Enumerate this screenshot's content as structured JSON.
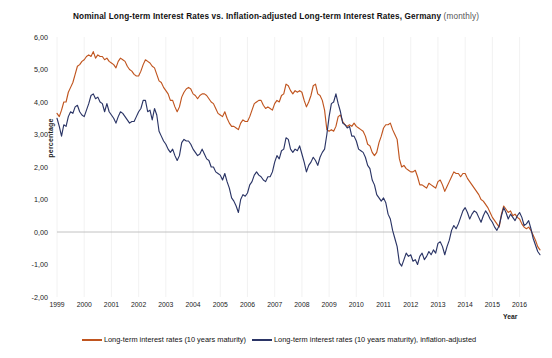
{
  "title": {
    "main": "Nominal Long-term Interest Rates vs. Inflation-adjusted Long-term Interest Rates, Germany",
    "suffix": "(monthly)"
  },
  "axes": {
    "ylabel": "percentage",
    "xlabel": "Year",
    "yticks": [
      "6,00",
      "5,00",
      "4,00",
      "3,00",
      "2,00",
      "1,00",
      "0,00",
      "-1,00",
      "-2,00"
    ],
    "xticks": [
      "1999",
      "2000",
      "2001",
      "2002",
      "2003",
      "2004",
      "2005",
      "2006",
      "2007",
      "2008",
      "2009",
      "2010",
      "2011",
      "2012",
      "2013",
      "2014",
      "2015",
      "2016"
    ]
  },
  "legend": {
    "items": [
      {
        "label": "Long-term interest rates (10 years maturity)",
        "color": "#C0551F"
      },
      {
        "label": "Long-term interest rates (10 years maturity), inflation-adjusted",
        "color": "#2B3566"
      }
    ]
  },
  "colors": {
    "nominal": "#C0551F",
    "real": "#2B3566",
    "zero_line": "#BBBBBB",
    "gridline": "#EFEFEF",
    "text": "#1a1a1a",
    "background": "#FFFFFF"
  },
  "chart_data": {
    "type": "line",
    "title": "Nominal Long-term Interest Rates vs. Inflation-adjusted Long-term Interest Rates, Germany (monthly)",
    "xlabel": "Year",
    "ylabel": "percentage",
    "xlim": [
      1999.0,
      2016.75
    ],
    "ylim": [
      -2.0,
      6.0
    ],
    "grid": true,
    "legend_position": "bottom",
    "x_tick_values": [
      1999,
      2000,
      2001,
      2002,
      2003,
      2004,
      2005,
      2006,
      2007,
      2008,
      2009,
      2010,
      2011,
      2012,
      2013,
      2014,
      2015,
      2016
    ],
    "y_tick_values": [
      6.0,
      5.0,
      4.0,
      3.0,
      2.0,
      1.0,
      0.0,
      -1.0,
      -2.0
    ],
    "series": [
      {
        "name": "Long-term interest rates (10 years maturity)",
        "color": "#C0551F",
        "x_start": 1999.0,
        "x_step": 0.0833333,
        "values": [
          3.65,
          3.55,
          3.75,
          4.0,
          4.0,
          4.3,
          4.45,
          4.6,
          4.85,
          5.1,
          5.15,
          5.25,
          5.3,
          5.4,
          5.45,
          5.4,
          5.55,
          5.35,
          5.45,
          5.4,
          5.4,
          5.3,
          5.35,
          5.25,
          5.2,
          5.15,
          5.05,
          5.25,
          5.35,
          5.3,
          5.25,
          5.1,
          5.0,
          4.95,
          4.85,
          4.8,
          4.8,
          4.95,
          5.15,
          5.3,
          5.25,
          5.2,
          5.1,
          5.05,
          4.85,
          4.65,
          4.6,
          4.45,
          4.35,
          4.25,
          4.05,
          4.05,
          3.85,
          3.7,
          3.85,
          4.15,
          4.3,
          4.4,
          4.45,
          4.4,
          4.25,
          4.2,
          4.1,
          4.2,
          4.25,
          4.25,
          4.2,
          4.1,
          4.0,
          3.95,
          3.8,
          3.65,
          3.6,
          3.55,
          3.7,
          3.5,
          3.35,
          3.25,
          3.25,
          3.2,
          3.15,
          3.35,
          3.45,
          3.4,
          3.4,
          3.55,
          3.75,
          3.95,
          4.0,
          4.05,
          4.05,
          3.9,
          3.8,
          3.85,
          3.8,
          3.75,
          3.95,
          4.05,
          4.0,
          4.2,
          4.25,
          4.55,
          4.5,
          4.35,
          4.25,
          4.35,
          4.3,
          4.35,
          4.3,
          4.05,
          3.85,
          4.0,
          4.2,
          4.5,
          4.55,
          4.25,
          4.2,
          4.05,
          3.75,
          3.15,
          3.1,
          3.15,
          3.1,
          3.25,
          3.55,
          3.6,
          3.4,
          3.3,
          3.25,
          3.3,
          3.25,
          3.35,
          3.25,
          3.2,
          3.15,
          3.1,
          2.95,
          2.7,
          2.65,
          2.45,
          2.35,
          2.45,
          2.75,
          2.95,
          3.2,
          3.3,
          3.3,
          3.35,
          3.15,
          3.0,
          2.85,
          2.25,
          2.0,
          2.05,
          1.95,
          1.9,
          1.85,
          1.85,
          1.9,
          1.7,
          1.45,
          1.45,
          1.4,
          1.35,
          1.5,
          1.45,
          1.4,
          1.35,
          1.55,
          1.6,
          1.45,
          1.25,
          1.4,
          1.55,
          1.7,
          1.85,
          1.8,
          1.8,
          1.7,
          1.8,
          1.8,
          1.65,
          1.55,
          1.45,
          1.35,
          1.25,
          1.15,
          1.0,
          0.95,
          0.85,
          0.75,
          0.6,
          0.45,
          0.35,
          0.25,
          0.15,
          0.55,
          0.8,
          0.7,
          0.6,
          0.65,
          0.5,
          0.55,
          0.45,
          0.4,
          0.25,
          0.15,
          0.1,
          0.15,
          0.05,
          -0.1,
          -0.25,
          -0.45,
          -0.55
        ]
      },
      {
        "name": "Long-term interest rates (10 years maturity), inflation-adjusted",
        "color": "#2B3566",
        "x_start": 1999.0,
        "x_step": 0.0833333,
        "values": [
          3.5,
          3.25,
          2.95,
          3.3,
          3.25,
          3.55,
          3.7,
          3.65,
          3.85,
          3.9,
          3.7,
          3.6,
          3.55,
          3.75,
          3.95,
          4.2,
          4.25,
          4.1,
          4.15,
          4.0,
          3.95,
          3.7,
          3.95,
          3.7,
          3.6,
          3.5,
          3.35,
          3.55,
          3.7,
          3.65,
          3.55,
          3.45,
          3.35,
          3.4,
          3.4,
          3.55,
          3.7,
          3.8,
          4.05,
          4.05,
          3.7,
          3.75,
          3.45,
          3.8,
          3.6,
          3.1,
          2.95,
          2.8,
          2.7,
          2.55,
          2.45,
          2.55,
          2.35,
          2.2,
          2.35,
          2.75,
          2.85,
          2.8,
          2.8,
          2.7,
          2.55,
          2.45,
          2.35,
          2.4,
          2.55,
          2.4,
          2.25,
          2.2,
          2.0,
          2.0,
          1.85,
          1.8,
          1.75,
          1.6,
          1.8,
          1.55,
          1.35,
          1.05,
          0.95,
          0.8,
          0.6,
          1.0,
          1.15,
          1.1,
          1.2,
          1.45,
          1.55,
          1.75,
          1.85,
          1.75,
          1.7,
          1.6,
          1.55,
          1.7,
          1.7,
          1.85,
          2.15,
          2.35,
          2.25,
          2.5,
          2.55,
          2.9,
          2.85,
          2.55,
          2.45,
          2.55,
          2.5,
          2.65,
          2.4,
          2.15,
          1.85,
          2.05,
          2.15,
          2.3,
          2.2,
          2.05,
          2.3,
          2.45,
          2.55,
          3.0,
          3.55,
          3.95,
          4.0,
          4.25,
          3.95,
          3.7,
          3.35,
          3.3,
          3.2,
          3.25,
          2.95,
          2.95,
          2.8,
          2.55,
          2.5,
          2.45,
          2.3,
          2.05,
          1.95,
          1.6,
          1.45,
          1.15,
          1.05,
          0.95,
          1.05,
          0.9,
          0.55,
          0.4,
          0.05,
          -0.2,
          -0.45,
          -0.95,
          -1.05,
          -0.85,
          -0.65,
          -0.75,
          -0.7,
          -0.9,
          -0.85,
          -1.0,
          -0.75,
          -0.65,
          -0.85,
          -0.75,
          -0.6,
          -0.7,
          -0.55,
          -0.65,
          -0.35,
          -0.3,
          -0.45,
          -0.7,
          -0.45,
          -0.25,
          0.05,
          0.2,
          0.1,
          0.25,
          0.45,
          0.65,
          0.75,
          0.6,
          0.4,
          0.55,
          0.65,
          0.6,
          0.45,
          0.3,
          0.5,
          0.65,
          0.55,
          0.4,
          0.3,
          0.15,
          0.05,
          0.2,
          0.5,
          0.75,
          0.6,
          0.4,
          0.55,
          0.45,
          0.35,
          0.5,
          0.6,
          0.45,
          0.2,
          0.25,
          0.35,
          0.1,
          -0.2,
          -0.4,
          -0.6,
          -0.7
        ]
      }
    ]
  }
}
